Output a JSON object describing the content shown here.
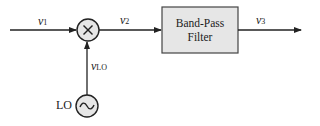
{
  "diagram": {
    "type": "block-diagram",
    "signals": {
      "input": {
        "symbol": "v",
        "subscript": "1"
      },
      "mixer_output": {
        "symbol": "v",
        "subscript": "2"
      },
      "output": {
        "symbol": "v",
        "subscript": "3"
      },
      "lo_signal": {
        "symbol": "v",
        "subscript": "LO"
      }
    },
    "blocks": {
      "mixer": {
        "symbol": "×"
      },
      "filter": {
        "line1": "Band-Pass",
        "line2": "Filter"
      },
      "oscillator": {
        "label": "LO",
        "symbol": "~"
      }
    },
    "colors": {
      "stroke": "#222222",
      "fill": "#e6e6e6",
      "background": "#ffffff"
    }
  }
}
